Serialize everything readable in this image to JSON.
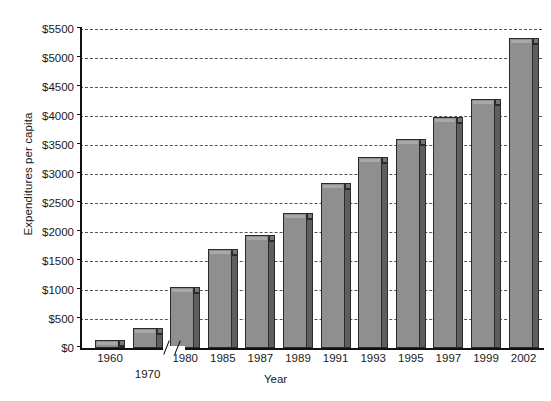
{
  "chart_data": {
    "type": "bar",
    "title": "",
    "xlabel": "Year",
    "ylabel": "Expenditures per capita",
    "categories": [
      "1960",
      "1970",
      "1980",
      "1985",
      "1987",
      "1989",
      "1991",
      "1993",
      "1995",
      "1997",
      "1999",
      "2002"
    ],
    "values": [
      145,
      350,
      1055,
      1710,
      1950,
      2330,
      2840,
      3300,
      3600,
      3990,
      4300,
      5340
    ],
    "ylim": [
      0,
      5500
    ],
    "ytick_step": 500,
    "ytick_labels": [
      "$0",
      "$500",
      "$1000",
      "$1500",
      "$2000",
      "$2500",
      "$3000",
      "$3500",
      "$4000",
      "$4500",
      "$5000",
      "$5500"
    ],
    "ytick_values": [
      0,
      500,
      1000,
      1500,
      2000,
      2500,
      3000,
      3500,
      4000,
      4500,
      5000,
      5500
    ],
    "grid": true,
    "grid_style": "dashed",
    "legend": "none",
    "axis_break": {
      "present": true,
      "between": [
        "1980",
        "1985"
      ],
      "glyph": "double-slash"
    },
    "offset_labels": [
      "1970"
    ],
    "colors": {
      "bar_face": "#8f8f8f",
      "bar_side": "#5e5e5e",
      "bar_outline": "#2b2b2b",
      "grid": "#555555",
      "axis": "#111111",
      "background": "#ffffff"
    }
  }
}
